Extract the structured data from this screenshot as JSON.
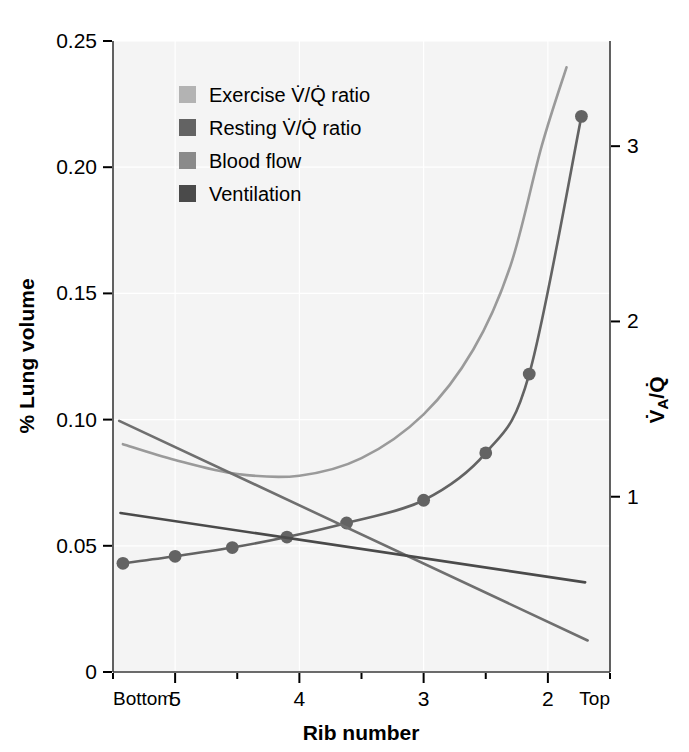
{
  "chart_data": {
    "type": "line",
    "title": "",
    "xlabel": "Rib number",
    "ylabel": "% Lung volume",
    "y2label": "VA/Q",
    "y2label_display": "V̇A/Q̇",
    "background": "#f4f4f4",
    "grid": true,
    "legend_position": "top-left-inside",
    "xaxis": {
      "label": "Rib number",
      "left_endpoint_label": "Bottom",
      "right_endpoint_label": "Top",
      "tick_labels": [
        "5",
        "4",
        "3",
        "2"
      ],
      "tick_values": [
        5,
        4,
        3,
        2
      ],
      "minor_ticks": true,
      "range": [
        5.5,
        1.5
      ]
    },
    "yaxis_left": {
      "label": "% Lung volume",
      "tick_labels": [
        "0",
        "0.05",
        "0.10",
        "0.15",
        "0.20",
        "0.25"
      ],
      "tick_values": [
        0,
        0.05,
        0.1,
        0.15,
        0.2,
        0.25
      ],
      "range": [
        0,
        0.25
      ]
    },
    "yaxis_right": {
      "label": "V̇A/Q̇",
      "tick_labels": [
        "1",
        "2",
        "3"
      ],
      "tick_values": [
        1,
        2,
        3
      ],
      "range": [
        0,
        3.6
      ]
    },
    "series": [
      {
        "name": "Exercise V̇/Q̇ ratio",
        "legend_label": "Exercise V/Q ratio",
        "color": "#9a9a9a",
        "axis": "right",
        "markers": false,
        "points": [
          {
            "x": 5.42,
            "y2": 1.3
          },
          {
            "x": 5.0,
            "y2": 1.21
          },
          {
            "x": 4.5,
            "y2": 1.13
          },
          {
            "x": 4.0,
            "y2": 1.12
          },
          {
            "x": 3.5,
            "y2": 1.22
          },
          {
            "x": 3.0,
            "y2": 1.47
          },
          {
            "x": 2.6,
            "y2": 1.84
          },
          {
            "x": 2.3,
            "y2": 2.32
          },
          {
            "x": 2.05,
            "y2": 3.0
          },
          {
            "x": 1.85,
            "y2": 3.45
          }
        ]
      },
      {
        "name": "Resting V̇/Q̇ ratio",
        "legend_label": "Resting V/Q ratio",
        "color": "#636363",
        "axis": "right",
        "markers": true,
        "points": [
          {
            "x": 5.42,
            "y2": 0.62
          },
          {
            "x": 5.0,
            "y2": 0.66
          },
          {
            "x": 4.54,
            "y2": 0.71
          },
          {
            "x": 4.1,
            "y2": 0.77
          },
          {
            "x": 3.62,
            "y2": 0.85
          },
          {
            "x": 3.0,
            "y2": 0.98
          },
          {
            "x": 2.5,
            "y2": 1.25
          },
          {
            "x": 2.15,
            "y2": 1.7
          },
          {
            "x": 1.73,
            "y2": 3.17
          }
        ]
      },
      {
        "name": "Blood flow",
        "legend_label": "Blood flow",
        "color": "#6f6f6f",
        "axis": "left",
        "markers": false,
        "points": [
          {
            "x": 5.45,
            "y": 0.0995
          },
          {
            "x": 1.68,
            "y": 0.0125
          }
        ]
      },
      {
        "name": "Ventilation",
        "legend_label": "Ventilation",
        "color": "#4a4a4a",
        "axis": "left",
        "markers": false,
        "points": [
          {
            "x": 5.44,
            "y": 0.063
          },
          {
            "x": 1.7,
            "y": 0.0355
          }
        ]
      }
    ]
  },
  "legend": {
    "items": [
      {
        "label_prefix": "Exercise ",
        "label_mid": "V/Q",
        "label_suffix": " ratio",
        "swatch_color": "#b3b3b3"
      },
      {
        "label_prefix": "Resting ",
        "label_mid": "V/Q",
        "label_suffix": " ratio",
        "swatch_color": "#636363"
      },
      {
        "label_prefix": "Blood flow",
        "label_mid": "",
        "label_suffix": "",
        "swatch_color": "#8a8a8a"
      },
      {
        "label_prefix": "Ventilation",
        "label_mid": "",
        "label_suffix": "",
        "swatch_color": "#4a4a4a"
      }
    ]
  }
}
